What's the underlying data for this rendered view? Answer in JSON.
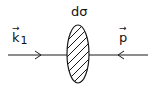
{
  "diagram": {
    "cross_section_label": "dσ",
    "incoming_left_label": "k",
    "incoming_left_subscript": "1",
    "incoming_right_label": "p",
    "vector_arrow": "→",
    "stroke_color": "#1a1a1a",
    "background": "#ffffff"
  }
}
